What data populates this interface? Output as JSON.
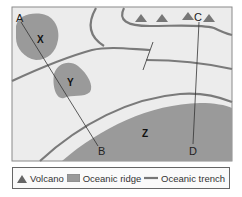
{
  "diagram": {
    "points": {
      "A": "A",
      "B": "B",
      "C": "C",
      "D": "D"
    },
    "regions": {
      "X": "X",
      "Y": "Y",
      "Z": "Z"
    },
    "volcano_count": 4
  },
  "legend": {
    "items": [
      {
        "icon": "volcano-icon",
        "label": "Volcano"
      },
      {
        "icon": "oceanic-ridge-icon",
        "label": "Oceanic ridge"
      },
      {
        "icon": "oceanic-trench-icon",
        "label": "Oceanic trench"
      }
    ]
  },
  "colors": {
    "background": "#ececec",
    "landmass": "#9a9a9a",
    "trench": "#7a7a7a",
    "line": "#333333",
    "frame": "#777777"
  }
}
